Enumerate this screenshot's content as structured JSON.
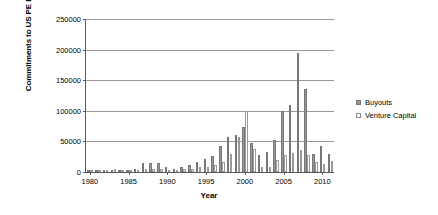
{
  "chart_data": {
    "type": "bar",
    "title": "",
    "xlabel": "Year",
    "ylabel": "Commitments to US PE Funds ($ Mil)",
    "ylim": [
      0,
      250000
    ],
    "ytick_values": [
      0,
      50000,
      100000,
      150000,
      200000,
      250000
    ],
    "ytick_labels": [
      "0",
      "50000",
      "100000",
      "150000",
      "200000",
      "250000"
    ],
    "xlim": [
      1979.5,
      2011.5
    ],
    "xtick_values": [
      1980,
      1985,
      1990,
      1995,
      2000,
      2005,
      2010
    ],
    "xtick_labels": [
      "1980",
      "1985",
      "1990",
      "1995",
      "2000",
      "2005",
      "2010"
    ],
    "grid": "horizontal",
    "legend_position": "right",
    "categories": [
      1980,
      1981,
      1982,
      1983,
      1984,
      1985,
      1986,
      1987,
      1988,
      1989,
      1990,
      1991,
      1992,
      1993,
      1994,
      1995,
      1996,
      1997,
      1998,
      1999,
      2000,
      2001,
      2002,
      2003,
      2004,
      2005,
      2006,
      2007,
      2008,
      2009,
      2010,
      2011
    ],
    "series": [
      {
        "name": "Buyouts",
        "color": "#989898",
        "values": [
          500,
          800,
          900,
          1800,
          3500,
          3800,
          4500,
          14000,
          15000,
          14000,
          8000,
          5000,
          9000,
          12000,
          17000,
          22000,
          26000,
          42000,
          57000,
          60000,
          73000,
          48000,
          27000,
          32000,
          52000,
          100000,
          110000,
          195000,
          135000,
          30000,
          42000,
          30000
        ]
      },
      {
        "name": "Venture Capital",
        "color": "#ffffff",
        "values": [
          800,
          1400,
          1700,
          4500,
          3200,
          3300,
          3800,
          4200,
          4500,
          5000,
          3300,
          2000,
          5000,
          4500,
          7800,
          9000,
          11500,
          17000,
          29000,
          58000,
          100000,
          38000,
          9000,
          9000,
          19000,
          28000,
          31000,
          36000,
          28000,
          16000,
          13000,
          18000
        ]
      }
    ]
  }
}
